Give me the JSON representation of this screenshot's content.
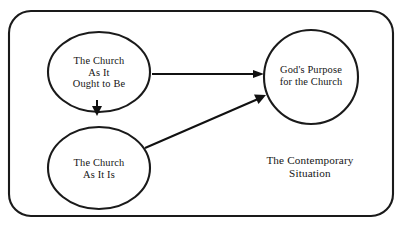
{
  "figure": {
    "kind": "concept-diagram",
    "background_color": "#ffffff",
    "ink_color": "#1a1a1a"
  },
  "frame": {
    "name": "contemporary-situation-frame",
    "shape": "rounded-rectangle",
    "x": 9,
    "y": 11,
    "width": 384,
    "height": 205,
    "corner_radius": 22,
    "caption": {
      "lines": [
        "The Contemporary",
        "Situation"
      ],
      "line1": "The Contemporary",
      "line2": "Situation",
      "center_x": 310,
      "center_y": 167
    }
  },
  "nodes": [
    {
      "id": "church-ought-to-be",
      "lines": [
        "The Church",
        "As It",
        "Ought to Be"
      ],
      "line1": "The Church",
      "line2": "As It",
      "line3": "Ought to Be",
      "cx": 99,
      "cy": 72,
      "rx": 51,
      "ry": 40
    },
    {
      "id": "church-as-it-is",
      "lines": [
        "The Church",
        "As It Is"
      ],
      "line1": "The Church",
      "line2": "As It Is",
      "cx": 99,
      "cy": 168,
      "rx": 51,
      "ry": 41
    },
    {
      "id": "gods-purpose",
      "lines": [
        "God's Purpose",
        "for the Church"
      ],
      "line1": "God's Purpose",
      "line2": "for the Church",
      "cx": 311,
      "cy": 77,
      "rx": 47,
      "ry": 47
    }
  ],
  "edges": [
    {
      "id": "ought-to-be-to-gods-purpose",
      "from": "church-ought-to-be",
      "to": "gods-purpose",
      "orientation": "horizontal",
      "x1": 152,
      "y1": 74,
      "x2": 264,
      "y2": 74
    },
    {
      "id": "ought-to-be-to-as-it-is",
      "from": "church-ought-to-be",
      "to": "church-as-it-is",
      "orientation": "vertical-short",
      "x1": 97,
      "y1": 100,
      "x2": 97,
      "y2": 114
    },
    {
      "id": "as-it-is-to-gods-purpose",
      "from": "church-as-it-is",
      "to": "gods-purpose",
      "orientation": "diagonal",
      "x1": 145,
      "y1": 148,
      "x2": 266,
      "y2": 95
    }
  ]
}
